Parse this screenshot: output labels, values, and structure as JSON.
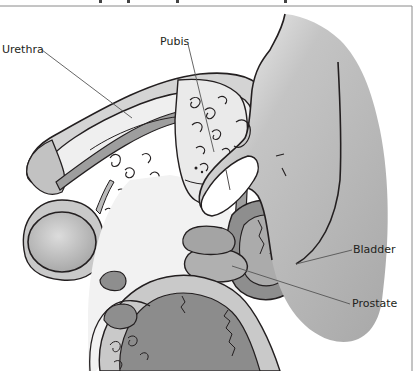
{
  "diagram": {
    "type": "anatomical-cross-section",
    "labels": [
      {
        "id": "urethra",
        "text": "Urethra",
        "x": 2,
        "y": 44,
        "target": [
          130,
          110
        ]
      },
      {
        "id": "pubis",
        "text": "Pubis",
        "x": 160,
        "y": 36,
        "target": [
          213,
          150
        ]
      },
      {
        "id": "bladder",
        "text": "Bladder",
        "x": 353,
        "y": 244,
        "target": [
          298,
          262
        ]
      },
      {
        "id": "prostate",
        "text": "Prostate",
        "x": 352,
        "y": 298,
        "target": [
          230,
          265
        ]
      }
    ]
  },
  "colors": {
    "outline": "#231f20",
    "dark_gray": "#8a8a8a",
    "mid_gray": "#a6a6a6",
    "light_gray": "#c9c9c9",
    "pale": "#efefef",
    "finger": "#b5b5b5",
    "leader_line": "#555555"
  }
}
